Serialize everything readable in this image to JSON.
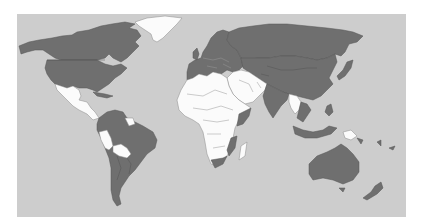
{
  "map": {
    "type": "world choropleth",
    "legend": [],
    "colors": {
      "background": "#ffffff",
      "ocean": "#cdcdcd",
      "highlighted": "#6f6f6f",
      "not_highlighted": "#fbfbfb"
    },
    "highlighted_regions": [
      "Canada",
      "United States",
      "Greenland-excluded",
      "Europe",
      "Russia",
      "Central Asia",
      "China",
      "Mongolia",
      "India",
      "Pakistan",
      "Japan",
      "Southeast Asia (partial)",
      "Indonesia",
      "Philippines",
      "Australia",
      "New Zealand",
      "Brazil",
      "Argentina",
      "Chile",
      "Colombia",
      "Venezuela",
      "Caribbean (partial)",
      "South Africa",
      "Mozambique",
      "Somalia",
      "Madagascar-excluded"
    ],
    "non_highlighted_regions": [
      "Greenland",
      "Mexico",
      "Central America",
      "Peru",
      "Bolivia",
      "Guyana/Suriname",
      "Most of Africa",
      "Middle East",
      "Iran",
      "Afghanistan",
      "Myanmar/Thailand (partial)",
      "Papua New Guinea",
      "Madagascar"
    ]
  }
}
